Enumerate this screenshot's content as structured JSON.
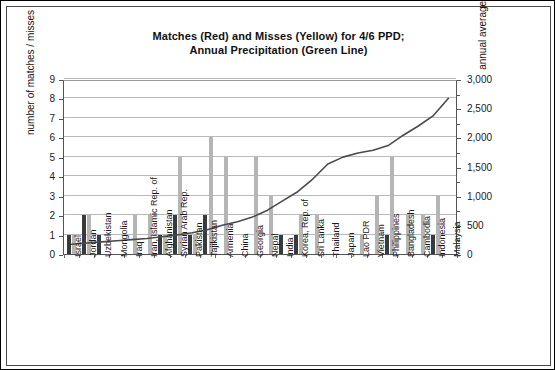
{
  "chart_data": {
    "type": "bar",
    "title": "Matches (Red) and Misses (Yellow) for 4/6 PPD; Annual Precipitation (Green Line)",
    "title_line1": "Matches (Red) and Misses (Yellow) for 4/6 PPD;",
    "title_line2": "Annual Precipitation (Green Line)",
    "xlabel": "",
    "ylabel": "number of matches / misses",
    "y2label": "annual average precipitation",
    "ylim": [
      0,
      9
    ],
    "y2lim": [
      0,
      3000
    ],
    "yticks": [
      "0",
      "1",
      "2",
      "3",
      "4",
      "5",
      "6",
      "7",
      "8",
      "9"
    ],
    "y2ticks": [
      "0",
      "500",
      "1,000",
      "1,500",
      "2,000",
      "2,500",
      "3,000"
    ],
    "grid": true,
    "legend_position": "none",
    "categories": [
      "Israel",
      "Jordan",
      "Uzbekistan",
      "Mongolia",
      "Iraq",
      "Iran, Islamic Rep. of",
      "Afghanistan",
      "Syrian Arab Rep.",
      "Pakistan",
      "Tajikistan",
      "Armenia",
      "China",
      "Georgia",
      "Nepal",
      "India",
      "Korea, Rep. of",
      "Sri Lanka",
      "Thailand",
      "Japan",
      "Lao PDR",
      "Vietnam",
      "Philippines",
      "Bangladesh",
      "Cambodia",
      "Indonesia",
      "Malaysia"
    ],
    "series": [
      {
        "name": "Matches (Red)",
        "color": "#3a3a3a",
        "axis": "left",
        "values": [
          1,
          2,
          1,
          0,
          0,
          0,
          1,
          2,
          1,
          2,
          0,
          0,
          0,
          0,
          1,
          1,
          0,
          0,
          0,
          0,
          0,
          1,
          0,
          0,
          1,
          0
        ]
      },
      {
        "name": "Misses (Yellow)",
        "color": "#b5b5b5",
        "axis": "left",
        "values": [
          1,
          2,
          0,
          0,
          2,
          2,
          1,
          5,
          1,
          6,
          5,
          0,
          5,
          3,
          0,
          2,
          2,
          0,
          0,
          1,
          3,
          5,
          2,
          2,
          3,
          0
        ]
      },
      {
        "name": "Annual Precipitation (Green Line)",
        "color": "#4a4a4a",
        "axis": "right",
        "values": [
          170,
          190,
          210,
          230,
          250,
          270,
          300,
          330,
          370,
          420,
          500,
          560,
          640,
          760,
          920,
          1080,
          1300,
          1560,
          1680,
          1750,
          1800,
          1880,
          2060,
          2220,
          2400,
          2700
        ]
      }
    ]
  }
}
